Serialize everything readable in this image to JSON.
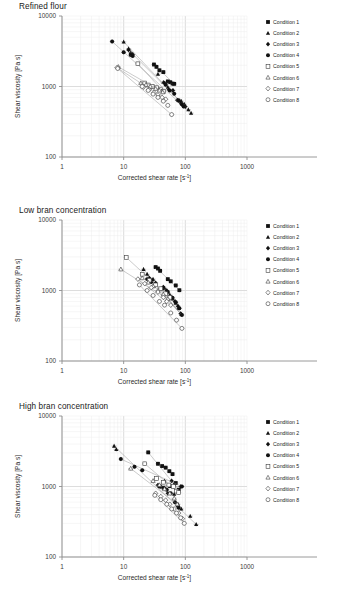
{
  "figure": {
    "background": "#ffffff",
    "panel_count": 3
  },
  "axes": {
    "xlabel_main": "Corrected shear rate [s",
    "xlabel_sup": "-1",
    "xlabel_tail": "]",
    "xlabel_full": "Corrected shear rate [s-1]",
    "ylabel": "Shear viscosity [Pa s]",
    "xticks": [
      "1",
      "10",
      "100",
      "1000"
    ],
    "yticks": [
      "100",
      "1000",
      "10000"
    ],
    "xlim": [
      1,
      1000
    ],
    "ylim": [
      100,
      10000
    ],
    "xscale": "log",
    "yscale": "log",
    "grid": "minor-log-gridlines-both-axes",
    "grid_color": "#e3e3e3",
    "axis_color": "#9a9a9a"
  },
  "legend": {
    "position": "right-outside",
    "items": [
      {
        "label": "Condition 1",
        "marker": "filled-square",
        "color": "#111111"
      },
      {
        "label": "Condition 2",
        "marker": "filled-triangle",
        "color": "#111111"
      },
      {
        "label": "Condition 3",
        "marker": "filled-diamond",
        "color": "#111111"
      },
      {
        "label": "Condition 4",
        "marker": "filled-circle",
        "color": "#111111"
      },
      {
        "label": "Condition 5",
        "marker": "open-square",
        "color": "#555555"
      },
      {
        "label": "Condition 6",
        "marker": "open-triangle",
        "color": "#555555"
      },
      {
        "label": "Condition 7",
        "marker": "open-diamond",
        "color": "#555555"
      },
      {
        "label": "Condition 8",
        "marker": "open-circle",
        "color": "#555555"
      }
    ]
  },
  "chart_data": [
    {
      "type": "scatter",
      "title": "Refined flour",
      "xlabel": "Corrected shear rate [s-1]",
      "ylabel": "Shear viscosity [Pa s]",
      "xscale": "log",
      "yscale": "log",
      "xlim": [
        1,
        1000
      ],
      "ylim": [
        100,
        10000
      ],
      "errorbars": true,
      "series": [
        {
          "name": "Condition 1",
          "marker": "filled-square",
          "points": [
            [
              31,
              2050
            ],
            [
              34,
              1900
            ],
            [
              38,
              1700
            ],
            [
              44,
              1600
            ],
            [
              52,
              1180
            ],
            [
              57,
              1150
            ],
            [
              62,
              1100
            ],
            [
              66,
              1090
            ]
          ]
        },
        {
          "name": "Condition 2",
          "marker": "filled-triangle",
          "points": [
            [
              10,
              4300
            ],
            [
              12,
              3450
            ],
            [
              13,
              3050
            ],
            [
              36,
              1500
            ],
            [
              44,
              1150
            ],
            [
              52,
              980
            ],
            [
              86,
              620
            ],
            [
              96,
              560
            ],
            [
              112,
              470
            ],
            [
              124,
              420
            ]
          ]
        },
        {
          "name": "Condition 3",
          "marker": "filled-diamond",
          "points": [
            [
              12,
              3300
            ],
            [
              14,
              2850
            ],
            [
              46,
              1120
            ],
            [
              54,
              900
            ],
            [
              63,
              880
            ],
            [
              74,
              640
            ],
            [
              82,
              600
            ],
            [
              90,
              545
            ],
            [
              100,
              520
            ]
          ]
        },
        {
          "name": "Condition 4",
          "marker": "filled-circle",
          "points": [
            [
              6.5,
              4350
            ],
            [
              10,
              3050
            ],
            [
              13,
              2800
            ],
            [
              14,
              2700
            ],
            [
              48,
              1060
            ],
            [
              56,
              880
            ],
            [
              66,
              790
            ],
            [
              78,
              640
            ],
            [
              88,
              560
            ],
            [
              94,
              520
            ]
          ]
        },
        {
          "name": "Condition 5",
          "marker": "open-square",
          "points": [
            [
              17,
              2100
            ],
            [
              22,
              1120
            ],
            [
              25,
              1050
            ],
            [
              29,
              1000
            ],
            [
              34,
              960
            ],
            [
              40,
              900
            ],
            [
              44,
              850
            ]
          ]
        },
        {
          "name": "Condition 6",
          "marker": "open-triangle",
          "points": [
            [
              8.2,
              1900
            ],
            [
              19,
              1120
            ],
            [
              23,
              1060
            ],
            [
              27,
              1000
            ],
            [
              33,
              930
            ],
            [
              38,
              880
            ],
            [
              43,
              830
            ]
          ]
        },
        {
          "name": "Condition 7",
          "marker": "open-diamond",
          "points": [
            [
              7.8,
              1850
            ],
            [
              21,
              980
            ],
            [
              26,
              900
            ],
            [
              31,
              820
            ],
            [
              36,
              760
            ],
            [
              42,
              700
            ],
            [
              48,
              660
            ]
          ]
        },
        {
          "name": "Condition 8",
          "marker": "open-circle",
          "points": [
            [
              8.0,
              1800
            ],
            [
              20,
              1000
            ],
            [
              25,
              880
            ],
            [
              30,
              780
            ],
            [
              36,
              700
            ],
            [
              44,
              620
            ],
            [
              52,
              540
            ],
            [
              60,
              400
            ]
          ]
        }
      ]
    },
    {
      "type": "scatter",
      "title": "Low bran concentration",
      "xlabel": "Corrected shear rate [s-1]",
      "ylabel": "Shear viscosity [Pa s]",
      "xscale": "log",
      "yscale": "log",
      "xlim": [
        1,
        1000
      ],
      "ylim": [
        100,
        10000
      ],
      "errorbars": true,
      "series": [
        {
          "name": "Condition 1",
          "marker": "filled-square",
          "points": [
            [
              33,
              2150
            ],
            [
              36,
              2050
            ],
            [
              39,
              1900
            ],
            [
              52,
              1450
            ],
            [
              58,
              1350
            ],
            [
              70,
              1180
            ],
            [
              80,
              1010
            ]
          ]
        },
        {
          "name": "Condition 2",
          "marker": "filled-triangle",
          "points": [
            [
              21,
              2000
            ],
            [
              24,
              1700
            ],
            [
              30,
              1450
            ],
            [
              46,
              1080
            ],
            [
              56,
              870
            ],
            [
              62,
              760
            ],
            [
              70,
              660
            ],
            [
              78,
              560
            ],
            [
              86,
              460
            ]
          ]
        },
        {
          "name": "Condition 3",
          "marker": "filled-diamond",
          "points": [
            [
              26,
              1500
            ],
            [
              29,
              1400
            ],
            [
              33,
              1280
            ],
            [
              44,
              1120
            ],
            [
              50,
              1000
            ],
            [
              60,
              800
            ],
            [
              68,
              700
            ],
            [
              76,
              600
            ],
            [
              84,
              470
            ]
          ]
        },
        {
          "name": "Condition 4",
          "marker": "filled-circle",
          "points": [
            [
              24,
              1450
            ],
            [
              28,
              1320
            ],
            [
              32,
              1180
            ],
            [
              42,
              1050
            ],
            [
              52,
              950
            ],
            [
              62,
              790
            ],
            [
              70,
              680
            ],
            [
              80,
              560
            ],
            [
              88,
              450
            ]
          ]
        },
        {
          "name": "Condition 5",
          "marker": "open-square",
          "points": [
            [
              11,
              2950
            ],
            [
              20,
              1700
            ],
            [
              26,
              1400
            ],
            [
              33,
              1200
            ],
            [
              40,
              1060
            ],
            [
              48,
              900
            ],
            [
              56,
              800
            ]
          ]
        },
        {
          "name": "Condition 6",
          "marker": "open-triangle",
          "points": [
            [
              9,
              2000
            ],
            [
              20,
              1500
            ],
            [
              25,
              1300
            ],
            [
              30,
              1150
            ],
            [
              36,
              1000
            ],
            [
              44,
              880
            ],
            [
              52,
              760
            ]
          ]
        },
        {
          "name": "Condition 7",
          "marker": "open-diamond",
          "points": [
            [
              17,
              1450
            ],
            [
              22,
              1250
            ],
            [
              28,
              1100
            ],
            [
              36,
              950
            ],
            [
              44,
              800
            ],
            [
              50,
              700
            ],
            [
              58,
              620
            ]
          ]
        },
        {
          "name": "Condition 8",
          "marker": "open-circle",
          "points": [
            [
              18,
              1200
            ],
            [
              24,
              1000
            ],
            [
              30,
              850
            ],
            [
              38,
              700
            ],
            [
              46,
              620
            ],
            [
              58,
              480
            ],
            [
              72,
              380
            ],
            [
              88,
              290
            ]
          ]
        }
      ]
    },
    {
      "type": "scatter",
      "title": "High bran concentration",
      "xlabel": "Corrected shear rate [s-1]",
      "ylabel": "Shear viscosity [Pa s]",
      "xscale": "log",
      "yscale": "log",
      "xlim": [
        1,
        1000
      ],
      "ylim": [
        100,
        10000
      ],
      "errorbars": true,
      "series": [
        {
          "name": "Condition 1",
          "marker": "filled-square",
          "points": [
            [
              25,
              3050
            ],
            [
              36,
              2100
            ],
            [
              42,
              1950
            ],
            [
              48,
              1850
            ],
            [
              55,
              1650
            ],
            [
              62,
              1500
            ],
            [
              70,
              1120
            ],
            [
              78,
              900
            ]
          ]
        },
        {
          "name": "Condition 2",
          "marker": "filled-triangle",
          "points": [
            [
              7,
              3750
            ],
            [
              7.6,
              3350
            ],
            [
              46,
              1200
            ],
            [
              56,
              1000
            ],
            [
              66,
              780
            ],
            [
              76,
              560
            ],
            [
              86,
              480
            ],
            [
              120,
              380
            ],
            [
              150,
              290
            ]
          ]
        },
        {
          "name": "Condition 3",
          "marker": "filled-diamond",
          "points": [
            [
              36,
              1050
            ],
            [
              40,
              1000
            ],
            [
              46,
              950
            ],
            [
              52,
              800
            ],
            [
              60,
              1200
            ],
            [
              68,
              1100
            ],
            [
              76,
              520
            ],
            [
              84,
              1000
            ]
          ]
        },
        {
          "name": "Condition 4",
          "marker": "filled-circle",
          "points": [
            [
              9,
              2450
            ],
            [
              15,
              1900
            ],
            [
              20,
              1700
            ],
            [
              38,
              1000
            ],
            [
              44,
              950
            ],
            [
              50,
              900
            ],
            [
              58,
              800
            ],
            [
              68,
              600
            ],
            [
              78,
              500
            ],
            [
              88,
              1000
            ]
          ]
        },
        {
          "name": "Condition 5",
          "marker": "open-square",
          "points": [
            [
              22,
              2100
            ],
            [
              34,
              1300
            ],
            [
              44,
              1150
            ],
            [
              54,
              1050
            ],
            [
              64,
              1000
            ],
            [
              72,
              860
            ],
            [
              78,
              820
            ]
          ]
        },
        {
          "name": "Condition 6",
          "marker": "open-triangle",
          "points": [
            [
              13,
              1800
            ],
            [
              30,
              1200
            ],
            [
              38,
              1050
            ],
            [
              46,
              920
            ],
            [
              56,
              800
            ],
            [
              66,
              680
            ],
            [
              74,
              560
            ]
          ]
        },
        {
          "name": "Condition 7",
          "marker": "open-diamond",
          "points": [
            [
              33,
              800
            ],
            [
              40,
              720
            ],
            [
              48,
              640
            ],
            [
              56,
              560
            ],
            [
              66,
              480
            ],
            [
              78,
              420
            ],
            [
              90,
              350
            ]
          ]
        },
        {
          "name": "Condition 8",
          "marker": "open-circle",
          "points": [
            [
              32,
              750
            ],
            [
              40,
              650
            ],
            [
              50,
              560
            ],
            [
              60,
              480
            ],
            [
              72,
              420
            ],
            [
              84,
              360
            ],
            [
              96,
              300
            ]
          ]
        }
      ]
    }
  ]
}
